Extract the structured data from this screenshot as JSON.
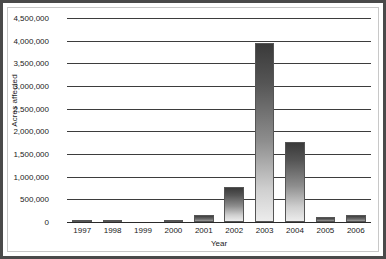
{
  "figure": {
    "border_color": "#4a4a4a",
    "inner_border_color": "#c8c8c8",
    "background": "#ffffff"
  },
  "chart_data": {
    "type": "bar",
    "title": "",
    "xlabel": "Year",
    "ylabel": "Acres affected",
    "categories": [
      "1997",
      "1998",
      "1999",
      "2000",
      "2001",
      "2002",
      "2003",
      "2004",
      "2005",
      "2006"
    ],
    "values": [
      40000,
      55000,
      0,
      40000,
      150000,
      780000,
      3950000,
      1760000,
      110000,
      150000
    ],
    "ylim": [
      0,
      4500000
    ],
    "yticks": [
      0,
      500000,
      1000000,
      1500000,
      2000000,
      2500000,
      3000000,
      3500000,
      4000000,
      4500000
    ],
    "ytick_labels": [
      "0",
      "500,000",
      "1,000,000",
      "1,500,000",
      "2,000,000",
      "2,500,000",
      "3,000,000",
      "3,500,000",
      "4,000,000",
      "4,500,000"
    ],
    "grid": true,
    "grid_axis": "y",
    "legend": false,
    "bar_fill": "gradient-dark-top-to-light-bottom",
    "bar_color_top": "#3a3a3a",
    "bar_color_bottom": "#ececec",
    "axis_color": "#2a2a2a",
    "gridline_color": "#3d3d3d"
  }
}
